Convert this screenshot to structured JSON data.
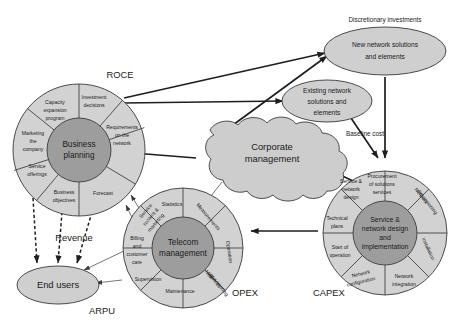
{
  "diagram": {
    "title_caption": "",
    "background": "#ffffff",
    "colors": {
      "segment_fill": "#d2d2d2",
      "hub_fill": "#9d9d9d",
      "node_fill": "#cfcfcf",
      "cloud_fill": "#cdcdcd",
      "stroke": "#3a3a3a",
      "text": "#1a1a1a"
    },
    "corner_labels": [
      {
        "id": "roce",
        "text": "ROCE"
      },
      {
        "id": "arpu",
        "text": "ARPU"
      },
      {
        "id": "opex",
        "text": "OPEX"
      },
      {
        "id": "capex",
        "text": "CAPEX"
      }
    ],
    "edge_labels": [
      {
        "id": "discretionary-investments",
        "text": "Discretionary investments"
      },
      {
        "id": "baseline-cost",
        "text": "Baseline cost"
      },
      {
        "id": "revenue",
        "text": "Revenue"
      }
    ],
    "wheels": [
      {
        "id": "business-planning",
        "hub": "Business planning",
        "hub_lines": [
          "Business",
          "planning"
        ],
        "segments": [
          {
            "label": "Investment decisions",
            "lines": [
              "Investment",
              "decisions"
            ]
          },
          {
            "label": "Capacity expansion program",
            "lines": [
              "Capacity",
              "expansion",
              "program"
            ]
          },
          {
            "label": "Marketing the company",
            "lines": [
              "Marketing",
              "the",
              "company"
            ]
          },
          {
            "label": "Service offerings",
            "lines": [
              "Service",
              "offerings"
            ]
          },
          {
            "label": "Business objectives",
            "lines": [
              "Business",
              "objectives"
            ]
          },
          {
            "label": "Forecast",
            "lines": [
              "Forecast"
            ]
          },
          {
            "label": "Requirements on the network",
            "lines": [
              "Requirements",
              "on the",
              "network"
            ]
          }
        ]
      },
      {
        "id": "telecom-management",
        "hub": "Telecom management",
        "hub_lines": [
          "Telecom",
          "management"
        ],
        "segments": [
          {
            "label": "Statistics",
            "lines": [
              "Statistics"
            ]
          },
          {
            "label": "Measurements",
            "lines": [
              "Measurements"
            ]
          },
          {
            "label": "Operation",
            "lines": [
              "Operation"
            ]
          },
          {
            "label": "New services provisioning",
            "lines": [
              "New",
              "services",
              "provisioning"
            ]
          },
          {
            "label": "Maintenance",
            "lines": [
              "Maintenance"
            ]
          },
          {
            "label": "Supervision",
            "lines": [
              "Supervision"
            ]
          },
          {
            "label": "Billing and customer care",
            "lines": [
              "Billing",
              "and",
              "customer",
              "care"
            ]
          },
          {
            "label": "Service content & marketing",
            "lines": [
              "Service",
              "content &",
              "marketing"
            ]
          }
        ]
      },
      {
        "id": "service-network-design",
        "hub": "Service & network design and implementation",
        "hub_lines": [
          "Service &",
          "network design",
          "and",
          "implementation"
        ],
        "segments": [
          {
            "label": "Procurement of solutions services",
            "lines": [
              "Procurement",
              "of solutions",
              "services"
            ]
          },
          {
            "label": "Network dimensioning",
            "lines": [
              "Network",
              "dimensioning"
            ]
          },
          {
            "label": "Installation",
            "lines": [
              "Installation"
            ]
          },
          {
            "label": "Network integration",
            "lines": [
              "Network",
              "integration"
            ]
          },
          {
            "label": "Network configuration",
            "lines": [
              "Network",
              "configuration"
            ]
          },
          {
            "label": "Start of operation",
            "lines": [
              "Start of",
              "operation"
            ]
          },
          {
            "label": "Technical plans",
            "lines": [
              "Technical",
              "plans"
            ]
          },
          {
            "label": "Service & network design",
            "lines": [
              "Service &",
              "network",
              "design"
            ]
          }
        ]
      }
    ],
    "nodes": [
      {
        "id": "new-network-solutions",
        "label": "New network solutions and elements",
        "lines": [
          "New network solutions",
          "and elements"
        ],
        "shape": "ellipse"
      },
      {
        "id": "existing-network-solutions",
        "label": "Existing network solutions and elements",
        "lines": [
          "Existing network",
          "solutions and",
          "elements"
        ],
        "shape": "ellipse"
      },
      {
        "id": "end-users",
        "label": "End users",
        "lines": [
          "End users"
        ],
        "shape": "ellipse"
      },
      {
        "id": "corporate-management",
        "label": "Corporate management",
        "lines": [
          "Corporate",
          "management"
        ],
        "shape": "cloud"
      }
    ]
  }
}
